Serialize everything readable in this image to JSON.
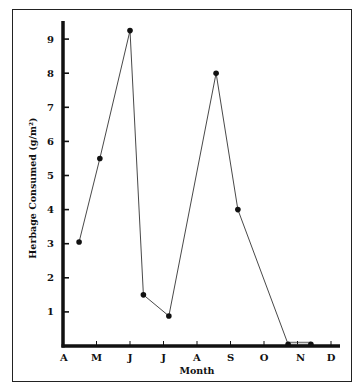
{
  "chart_data": {
    "type": "line",
    "title": "",
    "xlabel": "Month",
    "ylabel": "Herbage Consumed (g/m²)",
    "x_tick_labels": [
      "A",
      "M",
      "J",
      "J",
      "A",
      "S",
      "O",
      "N",
      "D"
    ],
    "y_tick_labels": [
      "1",
      "2",
      "3",
      "4",
      "5",
      "6",
      "7",
      "8",
      "9"
    ],
    "ylim": [
      0,
      9.5
    ],
    "xlim": [
      0,
      8.3
    ],
    "grid": false,
    "legend": null,
    "series": [
      {
        "name": "Herbage Consumed",
        "x_month_index": [
          0.48,
          1.1,
          2.0,
          2.4,
          3.16,
          4.57,
          5.22,
          6.72,
          7.4
        ],
        "x_approx_month": [
          "mid-Apr",
          "early May",
          "early Jun",
          "mid-Jun",
          "early Jul",
          "mid-Aug",
          "early Sep",
          "late Oct",
          "mid-Nov"
        ],
        "values": [
          3.05,
          5.5,
          9.25,
          1.5,
          0.88,
          8.0,
          4.0,
          0.05,
          0.05
        ]
      }
    ]
  },
  "axes": {
    "xlabel": "Month",
    "ylabel": "Herbage Consumed (g/m²)"
  }
}
